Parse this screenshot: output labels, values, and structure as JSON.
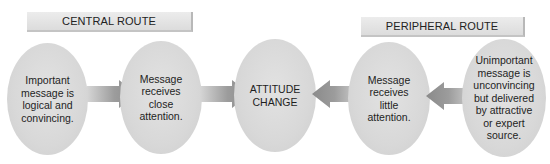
{
  "labels": {
    "central": "CENTRAL ROUTE",
    "peripheral": "PERIPHERAL ROUTE"
  },
  "nodes": [
    {
      "id": "central-start",
      "text": "Important\nmessage is\nlogical and\nconvincing."
    },
    {
      "id": "central-attention",
      "text": "Message\nreceives\nclose\nattention."
    },
    {
      "id": "attitude-change",
      "text": "ATTITUDE\nCHANGE"
    },
    {
      "id": "peripheral-attention",
      "text": "Message\nreceives\nlittle\nattention."
    },
    {
      "id": "peripheral-start",
      "text": "Unimportant\nmessage is\nunconvincing\nbut delivered\nby attractive\nor expert\nsource."
    }
  ],
  "arrows": [
    {
      "from": "central-start",
      "to": "central-attention",
      "direction": "right"
    },
    {
      "from": "central-attention",
      "to": "attitude-change",
      "direction": "right"
    },
    {
      "from": "peripheral-attention",
      "to": "attitude-change",
      "direction": "left"
    },
    {
      "from": "peripheral-start",
      "to": "peripheral-attention",
      "direction": "left"
    }
  ],
  "colors": {
    "ellipse": "#d8d8d8",
    "label_bg": "#e4e4e4",
    "arrow": "#9a9a9a"
  }
}
